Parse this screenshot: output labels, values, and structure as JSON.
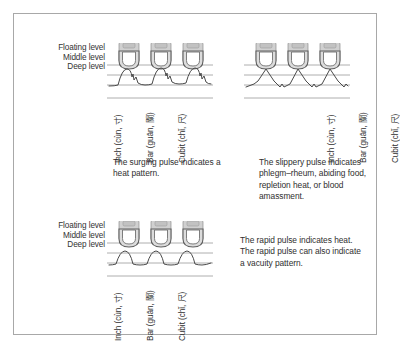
{
  "figure": {
    "levels": [
      "Floating level",
      "Middle level",
      "Deep level"
    ],
    "positions": [
      "Inch (cùn, 寸)",
      "Bar (guān, 關)",
      "Cubit (chǐ, 尺)"
    ],
    "colors": {
      "border": "#a8a8a8",
      "gridline": "#9a9a9a",
      "waveform": "#4a4a4a",
      "finger_fill": "#d4d4d4",
      "finger_outline": "#6f6f6f",
      "text": "#2f2f2f"
    }
  },
  "panels": [
    {
      "id": "surging",
      "pulse_name": "surging pulse",
      "caption": "The surging pulse indicates a heat pattern.",
      "levels": [
        "Floating level",
        "Middle level",
        "Deep level"
      ],
      "positions": [
        "Inch (cùn, 寸)",
        "Bar (guān, 關)",
        "Cubit (chǐ, 尺)"
      ]
    },
    {
      "id": "slippery",
      "pulse_name": "slippery pulse",
      "caption": "The slippery pulse indicates phlegm–rheum, abiding food, repletion heat, or blood amassment.",
      "levels": [
        "Floating level",
        "Middle level",
        "Deep level"
      ],
      "positions": [
        "Inch (cùn, 寸)",
        "Bar (guān, 關)",
        "Cubit (chǐ, 尺)"
      ]
    },
    {
      "id": "rapid",
      "pulse_name": "rapid pulse",
      "caption": "The rapid pulse indicates heat. The rapid pulse can also indicate a vacuity pattern.",
      "levels": [
        "Floating level",
        "Middle level",
        "Deep level"
      ],
      "positions": [
        "Inch (cùn, 寸)",
        "Bar (guān, 關)",
        "Cubit (chǐ, 尺)"
      ]
    }
  ]
}
